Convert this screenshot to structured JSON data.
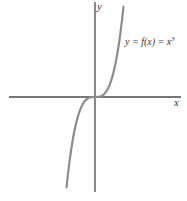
{
  "diagram": {
    "type": "function-graph",
    "equation_label": "y = f(x) = x",
    "equation_exponent": "3",
    "x_axis_label": "x",
    "y_axis_label": "y",
    "colors": {
      "axes": "#4a4a4a",
      "curve": "#8c8c8c",
      "text": "#333333",
      "background": "#ffffff"
    }
  },
  "chart_data": {
    "type": "line",
    "title": "",
    "function": "y = x^3",
    "xlabel": "x",
    "ylabel": "y",
    "grid": false,
    "annotations": [
      "y = f(x) = x^3"
    ]
  }
}
